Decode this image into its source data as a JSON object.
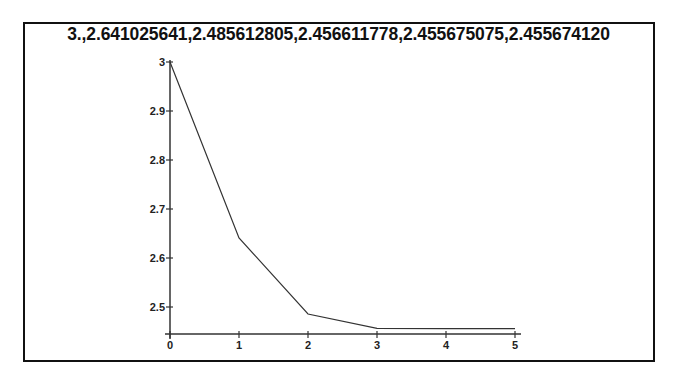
{
  "chart_data": {
    "type": "line",
    "title": "3.,2.641025641,2.485612805,2.456611778,2.455675075,2.455674120",
    "xlabel": "",
    "ylabel": "",
    "x": [
      0,
      1,
      2,
      3,
      4,
      5
    ],
    "series": [
      {
        "name": "sequence",
        "values": [
          3.0,
          2.641025641,
          2.485612805,
          2.456611778,
          2.455675075,
          2.45567412
        ]
      }
    ],
    "x_ticks": [
      "0",
      "1",
      "2",
      "3",
      "4",
      "5"
    ],
    "y_ticks": [
      "3",
      "2.9",
      "2.8",
      "2.7",
      "2.6",
      "2.5"
    ],
    "xlim": [
      0,
      5
    ],
    "ylim": [
      2.45,
      3.0
    ],
    "grid": false,
    "legend": "none",
    "line_color": "#333333"
  }
}
